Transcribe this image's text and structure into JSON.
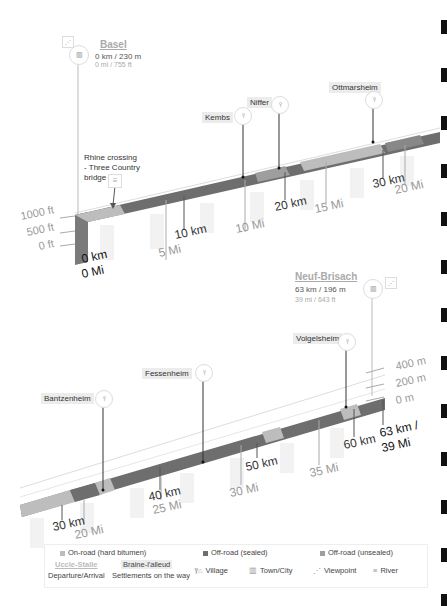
{
  "start": {
    "name": "Basel",
    "line1": "0 km / 230 m",
    "line2": "0 mi / 755 ft",
    "icon": "town-city-icon",
    "extra_icon": "viewpoint-icon"
  },
  "end": {
    "name": "Neuf-Brisach",
    "line1": "63 km / 196 m",
    "line2": "39 mi / 643 ft",
    "icon": "town-city-icon",
    "extra_icon": "viewpoint-icon"
  },
  "note": {
    "text_lines": [
      "Rhine crossing",
      "- Three Country",
      "bridge"
    ],
    "icon": "river-icon"
  },
  "settlements_top": [
    {
      "name": "Kembs",
      "icon": "village-icon"
    },
    {
      "name": "Niffer",
      "icon": "village-icon"
    },
    {
      "name": "Ottmarsheim",
      "icon": "village-icon"
    }
  ],
  "settlements_bottom": [
    {
      "name": "Bantzenheim",
      "icon": "village-icon"
    },
    {
      "name": "Fessenheim",
      "icon": "village-icon"
    },
    {
      "name": "Volgelsheim",
      "icon": "village-icon"
    }
  ],
  "axis_top": {
    "elevation": [
      "1000 ft",
      "500 ft",
      "0 ft"
    ],
    "start_km": "0 km",
    "start_mi": "0 Mi",
    "km": [
      "10 km",
      "20 km",
      "30 km"
    ],
    "mi": [
      "5 Mi",
      "10 Mi",
      "15 Mi",
      "20 Mi"
    ]
  },
  "axis_bottom": {
    "elevation": [
      "400 m",
      "200 m",
      "0 m"
    ],
    "end_km": "63 km /",
    "end_mi": "39 Mi",
    "km": [
      "30 km",
      "40 km",
      "50 km",
      "60 km"
    ],
    "mi": [
      "20 Mi",
      "25 Mi",
      "30 Mi",
      "35 Mi"
    ]
  },
  "legend": {
    "surfaces": [
      {
        "label": "On-road (hard bitumen)",
        "color": "#bdbdbd"
      },
      {
        "label": "Off-road (sealed)",
        "color": "#6e6e6e"
      },
      {
        "label": "Off-road (unsealed)",
        "color": "#9e9e9e"
      }
    ],
    "departure_example": "Uccle-Stalle",
    "departure_label": "Departure/Arrival",
    "settlement_example": "Braine-l'alleud",
    "settlement_label": "Settlements on the way",
    "icons": [
      {
        "label": "Village",
        "icon": "village-icon"
      },
      {
        "label": "Town/City",
        "icon": "town-city-icon"
      },
      {
        "label": "Viewpoint",
        "icon": "viewpoint-icon"
      },
      {
        "label": "River",
        "icon": "river-icon"
      }
    ]
  },
  "colors": {
    "bitumen": "#bdbdbd",
    "sealed": "#6e6e6e",
    "unsealed": "#9e9e9e",
    "side": "#7a7a7a"
  }
}
